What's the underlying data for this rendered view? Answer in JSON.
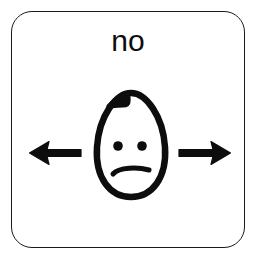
{
  "card": {
    "label": "no",
    "type": "communication-pictogram",
    "border_color": "#1a1a1a",
    "background_color": "#ffffff",
    "ink_color": "#0d0d0d",
    "corner_radius_px": 21
  },
  "illustration": {
    "subject": "head-shaking-face",
    "face": {
      "shape": "egg-oval",
      "outline_color": "#0d0d0d",
      "fill_color": "#ffffff",
      "features": {
        "hair_curl": "small-tuft-top-left",
        "eyes": "two-round-dots",
        "mouth": "straight-frown-line"
      }
    },
    "arrows": {
      "left": {
        "direction": "left",
        "color": "#0d0d0d",
        "meaning": "shake-head-left"
      },
      "right": {
        "direction": "right",
        "color": "#0d0d0d",
        "meaning": "shake-head-right"
      }
    }
  }
}
